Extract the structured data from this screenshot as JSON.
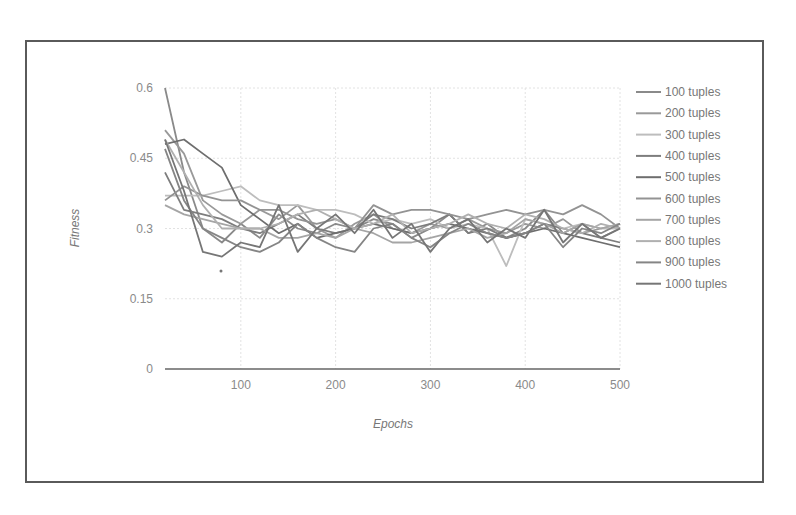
{
  "chart_data": {
    "type": "line",
    "title": "",
    "xlabel": "Epochs",
    "ylabel": "Fitness",
    "xlim": [
      20,
      500
    ],
    "ylim": [
      0,
      0.6
    ],
    "xticks": [
      100,
      200,
      300,
      400,
      500
    ],
    "yticks": [
      0,
      0.15,
      0.3,
      0.45,
      0.6
    ],
    "ytick_labels": [
      "0",
      "0.15",
      "0.3",
      "0.45",
      "0.6"
    ],
    "xtick_labels": [
      "100",
      "200",
      "300",
      "400",
      "500"
    ],
    "grid": true,
    "legend_position": "right",
    "x": [
      20,
      40,
      60,
      80,
      100,
      120,
      140,
      160,
      180,
      200,
      220,
      240,
      260,
      280,
      300,
      320,
      340,
      360,
      380,
      400,
      420,
      440,
      460,
      480,
      500
    ],
    "series": [
      {
        "name": "100 tuples",
        "color": "#8a8a8a",
        "values": [
          0.6,
          0.42,
          0.3,
          0.27,
          0.31,
          0.28,
          0.33,
          0.3,
          0.29,
          0.31,
          0.3,
          0.32,
          0.31,
          0.28,
          0.3,
          0.33,
          0.29,
          0.31,
          0.28,
          0.3,
          0.34,
          0.29,
          0.31,
          0.28,
          0.3
        ]
      },
      {
        "name": "200 tuples",
        "color": "#999999",
        "values": [
          0.51,
          0.46,
          0.36,
          0.33,
          0.31,
          0.34,
          0.32,
          0.35,
          0.3,
          0.28,
          0.31,
          0.33,
          0.3,
          0.29,
          0.31,
          0.3,
          0.32,
          0.3,
          0.29,
          0.31,
          0.3,
          0.32,
          0.29,
          0.3,
          0.31
        ]
      },
      {
        "name": "300 tuples",
        "color": "#bdbdbd",
        "values": [
          0.37,
          0.37,
          0.37,
          0.38,
          0.39,
          0.36,
          0.35,
          0.35,
          0.34,
          0.34,
          0.33,
          0.31,
          0.32,
          0.31,
          0.32,
          0.3,
          0.31,
          0.3,
          0.22,
          0.32,
          0.31,
          0.3,
          0.31,
          0.3,
          0.3
        ]
      },
      {
        "name": "400 tuples",
        "color": "#7d7d7d",
        "values": [
          0.42,
          0.34,
          0.33,
          0.32,
          0.3,
          0.29,
          0.31,
          0.33,
          0.3,
          0.29,
          0.3,
          0.33,
          0.32,
          0.3,
          0.31,
          0.33,
          0.29,
          0.3,
          0.28,
          0.29,
          0.31,
          0.3,
          0.29,
          0.28,
          0.27
        ]
      },
      {
        "name": "500 tuples",
        "color": "#6e6e6e",
        "values": [
          0.48,
          0.49,
          0.46,
          0.43,
          0.35,
          0.32,
          0.29,
          0.31,
          0.28,
          0.29,
          0.3,
          0.31,
          0.3,
          0.29,
          0.3,
          0.31,
          0.3,
          0.29,
          0.28,
          0.29,
          0.3,
          0.29,
          0.28,
          0.27,
          0.26
        ]
      },
      {
        "name": "600 tuples",
        "color": "#939393",
        "values": [
          0.36,
          0.39,
          0.37,
          0.36,
          0.36,
          0.34,
          0.34,
          0.32,
          0.31,
          0.32,
          0.3,
          0.35,
          0.33,
          0.34,
          0.34,
          0.33,
          0.32,
          0.33,
          0.34,
          0.33,
          0.34,
          0.33,
          0.35,
          0.33,
          0.3
        ]
      },
      {
        "name": "700 tuples",
        "color": "#a5a5a5",
        "values": [
          0.35,
          0.33,
          0.32,
          0.31,
          0.3,
          0.3,
          0.28,
          0.28,
          0.29,
          0.28,
          0.3,
          0.29,
          0.27,
          0.27,
          0.28,
          0.29,
          0.3,
          0.28,
          0.29,
          0.32,
          0.31,
          0.29,
          0.31,
          0.3,
          0.31
        ]
      },
      {
        "name": "800 tuples",
        "color": "#b0b0b0",
        "values": [
          0.49,
          0.42,
          0.35,
          0.3,
          0.3,
          0.3,
          0.31,
          0.33,
          0.34,
          0.32,
          0.3,
          0.31,
          0.33,
          0.29,
          0.3,
          0.31,
          0.33,
          0.31,
          0.3,
          0.33,
          0.32,
          0.3,
          0.29,
          0.31,
          0.3
        ]
      },
      {
        "name": "900 tuples",
        "color": "#858585",
        "values": [
          0.47,
          0.36,
          0.3,
          0.28,
          0.26,
          0.25,
          0.27,
          0.31,
          0.28,
          0.26,
          0.25,
          0.3,
          0.31,
          0.28,
          0.26,
          0.29,
          0.31,
          0.29,
          0.28,
          0.29,
          0.31,
          0.26,
          0.3,
          0.29,
          0.31
        ]
      },
      {
        "name": "1000 tuples",
        "color": "#767676",
        "values": [
          0.49,
          0.38,
          0.25,
          0.24,
          0.27,
          0.26,
          0.35,
          0.25,
          0.3,
          0.33,
          0.29,
          0.34,
          0.28,
          0.31,
          0.25,
          0.3,
          0.32,
          0.27,
          0.3,
          0.28,
          0.34,
          0.27,
          0.31,
          0.28,
          0.3
        ]
      }
    ]
  }
}
